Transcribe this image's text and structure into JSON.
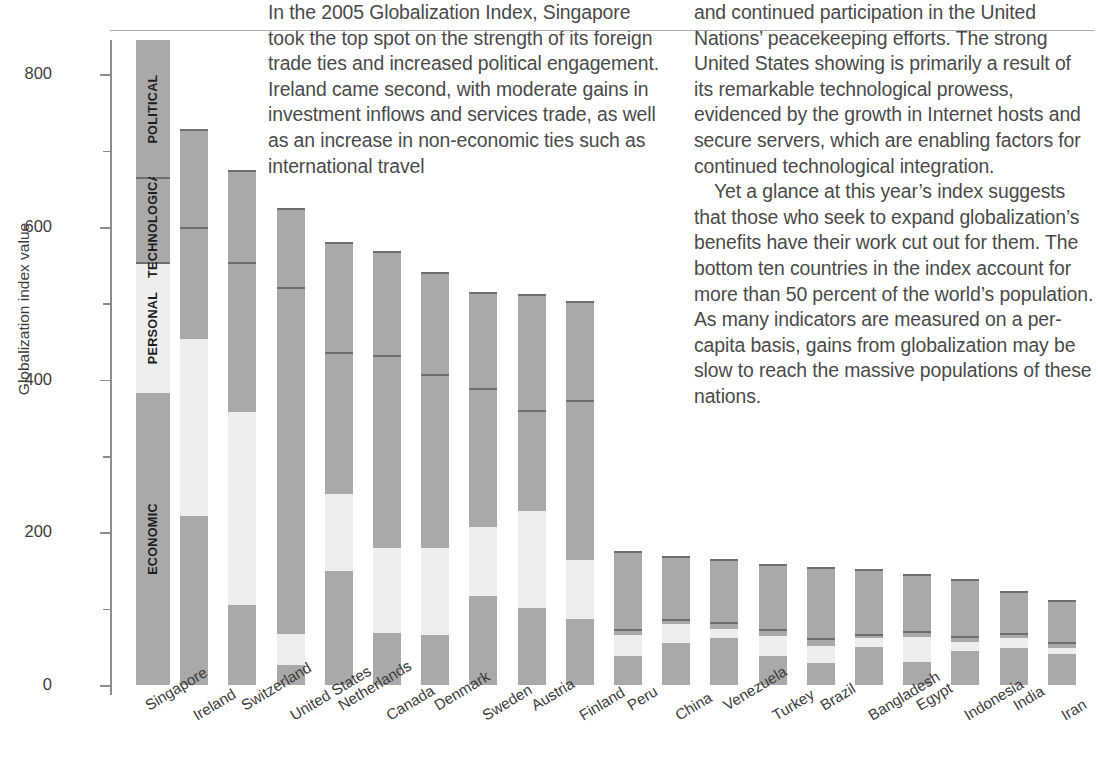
{
  "article": {
    "column1": "In the 2005 Globalization Index, Singapore took the top spot on the strength of its foreign trade ties and increased political engagement. Ireland came second, with moderate gains in investment inflows and services trade, as well as an increase in non-economic ties such as international travel",
    "column2_part1": "and continued participation in the United Nations’ peacekeeping efforts. The strong United States showing is primarily a result of its remarkable technological prowess, evidenced by the growth in Internet hosts and secure servers, which are enabling factors for continued technological integration.",
    "column2_part2": "Yet a glance at this year’s index suggests that those who seek to expand globalization’s benefits have their work cut out for them. The bottom ten countries in the index account for more than 50 percent of the world’s population. As many indicators are measured on a per-capita basis, gains from globalization may be slow to reach the massive populations of these nations."
  },
  "colors": {
    "bar_gray": "#a9a9a9",
    "bar_light": "#eeeeee",
    "divider": "#6f6f6f",
    "axis": "#8e8e8e",
    "text": "#3c3c3c"
  },
  "chart_data": {
    "type": "bar",
    "stacked": true,
    "title": "",
    "xlabel": "",
    "ylabel": "Globalization index value",
    "ylim": [
      0,
      845
    ],
    "yticks": [
      0,
      200,
      400,
      600,
      800
    ],
    "ytick_labels": [
      "0",
      "200",
      "400",
      "600",
      "800"
    ],
    "minor_yticks": [
      100,
      300,
      500,
      700
    ],
    "grid": false,
    "legend_position": "inline-first-bar",
    "segment_order": [
      "economic",
      "personal",
      "technological",
      "political"
    ],
    "series": [
      {
        "name": "ECONOMIC",
        "key": "economic",
        "color": "#a9a9a9"
      },
      {
        "name": "PERSONAL",
        "key": "personal",
        "color": "#eeeeee"
      },
      {
        "name": "TECHNOLOGICAL",
        "key": "technological",
        "color": "#a9a9a9"
      },
      {
        "name": "POLITICAL",
        "key": "political",
        "color": "#a9a9a9"
      }
    ],
    "legend_bar": {
      "total": 845,
      "bounds": [
        0,
        383,
        552,
        665,
        845
      ],
      "labels": [
        "ECONOMIC",
        "PERSONAL",
        "TECHNOLOGICAL",
        "POLITICAL"
      ]
    },
    "categories": [
      "Singapore",
      "Ireland",
      "Switzerland",
      "United States",
      "Netherlands",
      "Canada",
      "Denmark",
      "Sweden",
      "Austria",
      "Finland",
      "Peru",
      "China",
      "Venezuela",
      "Turkey",
      "Brazil",
      "Bangladesh",
      "Egypt",
      "Indonesia",
      "India",
      "Iran"
    ],
    "totals": [
      845,
      728,
      675,
      625,
      580,
      568,
      541,
      515,
      512,
      503,
      175,
      169,
      165,
      158,
      155,
      152,
      145,
      139,
      123,
      112
    ],
    "bars": [
      {
        "country": "Singapore",
        "economic": 383,
        "personal": 169,
        "technological": 113,
        "political": 180,
        "total": 845
      },
      {
        "country": "Ireland",
        "economic": 222,
        "personal": 231,
        "technological": 147,
        "political": 128,
        "total": 728
      },
      {
        "country": "Switzerland",
        "economic": 105,
        "personal": 253,
        "technological": 196,
        "political": 121,
        "total": 675
      },
      {
        "country": "United States",
        "economic": 26,
        "personal": 41,
        "technological": 455,
        "political": 103,
        "total": 625
      },
      {
        "country": "Netherlands",
        "economic": 150,
        "personal": 100,
        "technological": 186,
        "political": 144,
        "total": 580
      },
      {
        "country": "Canada",
        "economic": 68,
        "personal": 112,
        "technological": 253,
        "political": 135,
        "total": 568
      },
      {
        "country": "Denmark",
        "economic": 66,
        "personal": 113,
        "technological": 228,
        "political": 134,
        "total": 541
      },
      {
        "country": "Sweden",
        "economic": 117,
        "personal": 90,
        "technological": 182,
        "political": 126,
        "total": 515
      },
      {
        "country": "Austria",
        "economic": 101,
        "personal": 127,
        "technological": 132,
        "political": 152,
        "total": 512
      },
      {
        "country": "Finland",
        "economic": 86,
        "personal": 78,
        "technological": 209,
        "political": 130,
        "total": 503
      },
      {
        "country": "Peru",
        "economic": 38,
        "personal": 27,
        "technological": 8,
        "political": 102,
        "total": 175
      },
      {
        "country": "China",
        "economic": 55,
        "personal": 25,
        "technological": 7,
        "political": 82,
        "total": 169
      },
      {
        "country": "Venezuela",
        "economic": 62,
        "personal": 12,
        "technological": 8,
        "political": 83,
        "total": 165
      },
      {
        "country": "Turkey",
        "economic": 38,
        "personal": 26,
        "technological": 9,
        "political": 85,
        "total": 158
      },
      {
        "country": "Brazil",
        "economic": 29,
        "personal": 22,
        "technological": 10,
        "political": 94,
        "total": 155
      },
      {
        "country": "Bangladesh",
        "economic": 50,
        "personal": 11,
        "technological": 6,
        "political": 85,
        "total": 152
      },
      {
        "country": "Egypt",
        "economic": 30,
        "personal": 33,
        "technological": 8,
        "political": 74,
        "total": 145
      },
      {
        "country": "Indonesia",
        "economic": 45,
        "personal": 12,
        "technological": 7,
        "political": 75,
        "total": 139
      },
      {
        "country": "India",
        "economic": 48,
        "personal": 14,
        "technological": 6,
        "political": 55,
        "total": 123
      },
      {
        "country": "Iran",
        "economic": 40,
        "personal": 9,
        "technological": 7,
        "political": 56,
        "total": 112
      }
    ]
  }
}
